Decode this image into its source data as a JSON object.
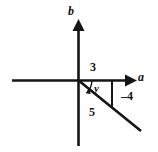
{
  "figure": {
    "kind": "right-triangle-on-axes",
    "background_color": "#ffffff",
    "stroke_color": "#151515",
    "width": 158,
    "height": 152
  },
  "axes": {
    "horizontal": {
      "label": "a",
      "origin_x": 78,
      "origin_y": 80,
      "start_x": 12,
      "end_x": 132,
      "has_arrow": true,
      "arrow_direction": "right"
    },
    "vertical": {
      "label": "b",
      "origin_x": 78,
      "origin_y": 80,
      "start_y": 22,
      "end_y": 146,
      "has_arrow": true,
      "arrow_direction": "up"
    }
  },
  "triangle": {
    "adjacent_label": "3",
    "opposite_label": "–4",
    "hypotenuse_label": "5",
    "angle_label": "y",
    "vertices": {
      "origin": [
        78,
        80
      ],
      "corner": [
        112,
        80
      ],
      "point": [
        112,
        108
      ]
    },
    "hypotenuse_extends_to": [
      141,
      131
    ],
    "angle_arc": {
      "center": [
        78,
        80
      ],
      "radius": 13,
      "has_arrowhead": true
    }
  },
  "labels": {
    "axis_b": "b",
    "axis_a": "a",
    "adjacent": "3",
    "opposite": "–4",
    "hypotenuse": "5",
    "angle": "y"
  }
}
